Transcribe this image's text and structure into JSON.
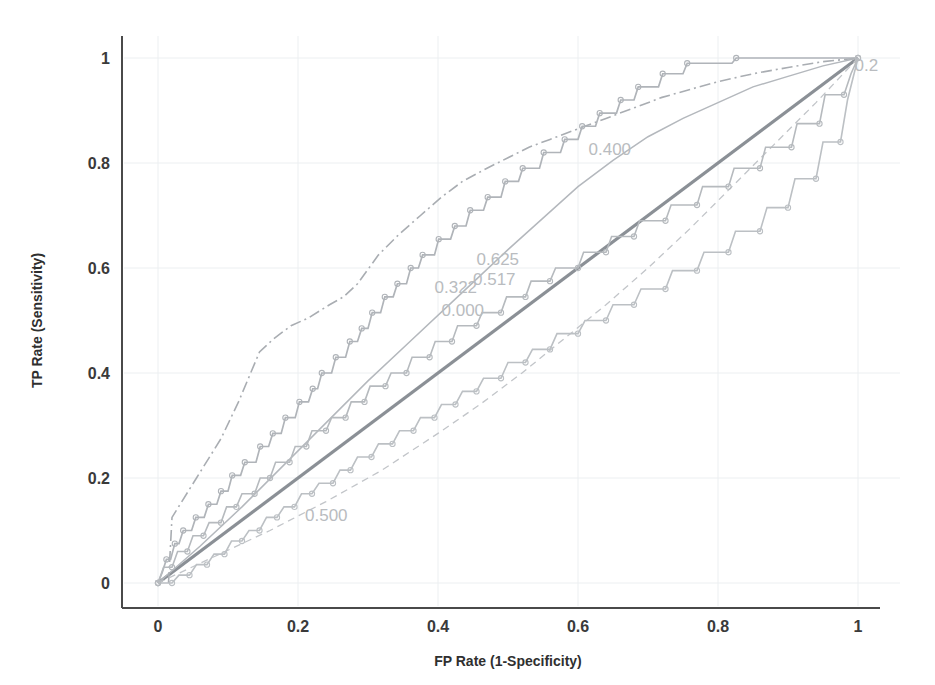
{
  "chart_data": {
    "type": "line",
    "title": "",
    "xlabel": "FP Rate (1-Specificity)",
    "ylabel": "TP Rate (Sensitivity)",
    "xlim": [
      0,
      1
    ],
    "ylim": [
      0,
      1
    ],
    "grid": false,
    "xticks": [
      "0",
      "0.2",
      "0.4",
      "0.6",
      "0.8",
      "1"
    ],
    "xtick_values": [
      0,
      0.2,
      0.4,
      0.6,
      0.8,
      1
    ],
    "yticks": [
      "0",
      "0.2",
      "0.4",
      "0.6",
      "0.8",
      "1"
    ],
    "ytick_values": [
      0,
      0.2,
      0.4,
      0.6,
      0.8,
      1
    ],
    "legend_position": "none",
    "annotations": [
      {
        "text": "0.2",
        "x": 0.995,
        "y": 0.975,
        "color": "#c3c6ca"
      },
      {
        "text": "0.400",
        "x": 0.615,
        "y": 0.815,
        "color": "#c3c6ca"
      },
      {
        "text": "0.625",
        "x": 0.455,
        "y": 0.605,
        "color": "#c0c3c7"
      },
      {
        "text": "0.517",
        "x": 0.45,
        "y": 0.568,
        "color": "#c0c3c7"
      },
      {
        "text": "0.322",
        "x": 0.395,
        "y": 0.552,
        "color": "#c6c9cd"
      },
      {
        "text": "0.000",
        "x": 0.405,
        "y": 0.508,
        "color": "#c6c9cd"
      },
      {
        "text": "0.500",
        "x": 0.21,
        "y": 0.118,
        "color": "#cbced2"
      }
    ],
    "series": [
      {
        "name": "reference-diagonal",
        "style": "solid-thick",
        "color": "#8b9096",
        "width": 3.2,
        "markers": false,
        "points": [
          [
            0,
            0
          ],
          [
            1,
            1
          ]
        ]
      },
      {
        "name": "smooth-roc-upper",
        "style": "solid-thin",
        "color": "#b4b8bd",
        "width": 1.5,
        "markers": false,
        "points": [
          [
            0,
            0
          ],
          [
            0.06,
            0.07
          ],
          [
            0.12,
            0.145
          ],
          [
            0.18,
            0.225
          ],
          [
            0.24,
            0.305
          ],
          [
            0.3,
            0.385
          ],
          [
            0.36,
            0.46
          ],
          [
            0.42,
            0.535
          ],
          [
            0.46,
            0.585
          ],
          [
            0.5,
            0.635
          ],
          [
            0.55,
            0.695
          ],
          [
            0.6,
            0.755
          ],
          [
            0.65,
            0.805
          ],
          [
            0.7,
            0.85
          ],
          [
            0.75,
            0.885
          ],
          [
            0.8,
            0.915
          ],
          [
            0.85,
            0.945
          ],
          [
            0.9,
            0.965
          ],
          [
            0.95,
            0.985
          ],
          [
            1,
            1
          ]
        ]
      },
      {
        "name": "dash-dot-roc",
        "style": "dash-dot",
        "color": "#a9adb2",
        "width": 1.6,
        "markers": false,
        "points": [
          [
            0.015,
            0.0
          ],
          [
            0.02,
            0.125
          ],
          [
            0.055,
            0.2
          ],
          [
            0.09,
            0.275
          ],
          [
            0.115,
            0.345
          ],
          [
            0.145,
            0.44
          ],
          [
            0.165,
            0.465
          ],
          [
            0.19,
            0.49
          ],
          [
            0.215,
            0.505
          ],
          [
            0.245,
            0.53
          ],
          [
            0.265,
            0.545
          ],
          [
            0.285,
            0.57
          ],
          [
            0.315,
            0.625
          ],
          [
            0.345,
            0.665
          ],
          [
            0.375,
            0.7
          ],
          [
            0.405,
            0.735
          ],
          [
            0.435,
            0.765
          ],
          [
            0.47,
            0.79
          ],
          [
            0.5,
            0.81
          ],
          [
            0.53,
            0.83
          ],
          [
            0.56,
            0.845
          ],
          [
            0.6,
            0.865
          ],
          [
            0.64,
            0.885
          ],
          [
            0.68,
            0.905
          ],
          [
            0.72,
            0.925
          ],
          [
            0.76,
            0.94
          ],
          [
            0.8,
            0.955
          ],
          [
            0.85,
            0.97
          ],
          [
            0.9,
            0.982
          ],
          [
            0.95,
            0.993
          ],
          [
            1,
            1
          ]
        ]
      },
      {
        "name": "dashed-lower-roc",
        "style": "dashed",
        "color": "#c2c5c9",
        "width": 1.3,
        "markers": false,
        "points": [
          [
            0,
            0
          ],
          [
            0.08,
            0.05
          ],
          [
            0.16,
            0.1
          ],
          [
            0.24,
            0.155
          ],
          [
            0.32,
            0.215
          ],
          [
            0.4,
            0.285
          ],
          [
            0.46,
            0.34
          ],
          [
            0.52,
            0.4
          ],
          [
            0.58,
            0.465
          ],
          [
            0.64,
            0.53
          ],
          [
            0.7,
            0.6
          ],
          [
            0.76,
            0.675
          ],
          [
            0.82,
            0.755
          ],
          [
            0.88,
            0.835
          ],
          [
            0.94,
            0.915
          ],
          [
            1,
            1
          ]
        ]
      },
      {
        "name": "step-roc-upper",
        "style": "step",
        "color": "#b0b4b9",
        "width": 1.7,
        "markers": true,
        "points": [
          [
            0,
            0
          ],
          [
            0.006,
            0.02
          ],
          [
            0.012,
            0.045
          ],
          [
            0.018,
            0.045
          ],
          [
            0.024,
            0.075
          ],
          [
            0.03,
            0.075
          ],
          [
            0.036,
            0.1
          ],
          [
            0.048,
            0.1
          ],
          [
            0.054,
            0.125
          ],
          [
            0.066,
            0.125
          ],
          [
            0.072,
            0.15
          ],
          [
            0.084,
            0.15
          ],
          [
            0.09,
            0.175
          ],
          [
            0.1,
            0.175
          ],
          [
            0.106,
            0.205
          ],
          [
            0.118,
            0.205
          ],
          [
            0.124,
            0.23
          ],
          [
            0.14,
            0.23
          ],
          [
            0.146,
            0.26
          ],
          [
            0.158,
            0.26
          ],
          [
            0.164,
            0.285
          ],
          [
            0.176,
            0.285
          ],
          [
            0.182,
            0.315
          ],
          [
            0.196,
            0.315
          ],
          [
            0.202,
            0.345
          ],
          [
            0.215,
            0.345
          ],
          [
            0.221,
            0.37
          ],
          [
            0.228,
            0.37
          ],
          [
            0.234,
            0.4
          ],
          [
            0.248,
            0.4
          ],
          [
            0.254,
            0.43
          ],
          [
            0.268,
            0.43
          ],
          [
            0.274,
            0.46
          ],
          [
            0.285,
            0.46
          ],
          [
            0.291,
            0.485
          ],
          [
            0.3,
            0.485
          ],
          [
            0.306,
            0.515
          ],
          [
            0.318,
            0.515
          ],
          [
            0.324,
            0.545
          ],
          [
            0.336,
            0.545
          ],
          [
            0.342,
            0.57
          ],
          [
            0.355,
            0.57
          ],
          [
            0.361,
            0.6
          ],
          [
            0.372,
            0.6
          ],
          [
            0.378,
            0.625
          ],
          [
            0.395,
            0.625
          ],
          [
            0.401,
            0.655
          ],
          [
            0.418,
            0.655
          ],
          [
            0.424,
            0.68
          ],
          [
            0.44,
            0.68
          ],
          [
            0.446,
            0.71
          ],
          [
            0.465,
            0.71
          ],
          [
            0.471,
            0.735
          ],
          [
            0.49,
            0.735
          ],
          [
            0.496,
            0.765
          ],
          [
            0.515,
            0.765
          ],
          [
            0.521,
            0.79
          ],
          [
            0.545,
            0.79
          ],
          [
            0.551,
            0.82
          ],
          [
            0.575,
            0.82
          ],
          [
            0.581,
            0.845
          ],
          [
            0.6,
            0.845
          ],
          [
            0.606,
            0.87
          ],
          [
            0.625,
            0.87
          ],
          [
            0.631,
            0.895
          ],
          [
            0.655,
            0.895
          ],
          [
            0.661,
            0.92
          ],
          [
            0.68,
            0.92
          ],
          [
            0.686,
            0.945
          ],
          [
            0.715,
            0.945
          ],
          [
            0.721,
            0.97
          ],
          [
            0.75,
            0.97
          ],
          [
            0.756,
            0.99
          ],
          [
            0.82,
            0.99
          ],
          [
            0.826,
            1.0
          ],
          [
            1,
            1
          ]
        ]
      },
      {
        "name": "step-roc-lower",
        "style": "step",
        "color": "#bcc0c4",
        "width": 1.6,
        "markers": true,
        "points": [
          [
            0,
            0
          ],
          [
            0.01,
            0.0
          ],
          [
            0.02,
            0.0
          ],
          [
            0.03,
            0.015
          ],
          [
            0.045,
            0.015
          ],
          [
            0.055,
            0.035
          ],
          [
            0.07,
            0.035
          ],
          [
            0.08,
            0.055
          ],
          [
            0.095,
            0.055
          ],
          [
            0.105,
            0.08
          ],
          [
            0.12,
            0.08
          ],
          [
            0.13,
            0.1
          ],
          [
            0.145,
            0.1
          ],
          [
            0.155,
            0.125
          ],
          [
            0.17,
            0.125
          ],
          [
            0.18,
            0.145
          ],
          [
            0.195,
            0.145
          ],
          [
            0.205,
            0.17
          ],
          [
            0.22,
            0.17
          ],
          [
            0.23,
            0.19
          ],
          [
            0.25,
            0.19
          ],
          [
            0.26,
            0.215
          ],
          [
            0.275,
            0.215
          ],
          [
            0.285,
            0.24
          ],
          [
            0.305,
            0.24
          ],
          [
            0.315,
            0.265
          ],
          [
            0.335,
            0.265
          ],
          [
            0.345,
            0.29
          ],
          [
            0.365,
            0.29
          ],
          [
            0.375,
            0.315
          ],
          [
            0.395,
            0.315
          ],
          [
            0.405,
            0.34
          ],
          [
            0.425,
            0.34
          ],
          [
            0.435,
            0.365
          ],
          [
            0.455,
            0.365
          ],
          [
            0.465,
            0.39
          ],
          [
            0.49,
            0.39
          ],
          [
            0.5,
            0.42
          ],
          [
            0.525,
            0.42
          ],
          [
            0.535,
            0.445
          ],
          [
            0.56,
            0.445
          ],
          [
            0.57,
            0.475
          ],
          [
            0.6,
            0.475
          ],
          [
            0.61,
            0.5
          ],
          [
            0.64,
            0.5
          ],
          [
            0.65,
            0.53
          ],
          [
            0.68,
            0.53
          ],
          [
            0.69,
            0.56
          ],
          [
            0.725,
            0.56
          ],
          [
            0.735,
            0.595
          ],
          [
            0.77,
            0.595
          ],
          [
            0.78,
            0.63
          ],
          [
            0.815,
            0.63
          ],
          [
            0.825,
            0.67
          ],
          [
            0.86,
            0.67
          ],
          [
            0.87,
            0.715
          ],
          [
            0.9,
            0.715
          ],
          [
            0.91,
            0.77
          ],
          [
            0.94,
            0.77
          ],
          [
            0.95,
            0.84
          ],
          [
            0.975,
            0.84
          ],
          [
            0.985,
            0.92
          ],
          [
            1,
            1
          ]
        ]
      },
      {
        "name": "step-roc-middle",
        "style": "step",
        "color": "#b6babe",
        "width": 1.6,
        "markers": true,
        "points": [
          [
            0,
            0
          ],
          [
            0.008,
            0.03
          ],
          [
            0.02,
            0.03
          ],
          [
            0.028,
            0.06
          ],
          [
            0.042,
            0.06
          ],
          [
            0.05,
            0.09
          ],
          [
            0.065,
            0.09
          ],
          [
            0.073,
            0.115
          ],
          [
            0.09,
            0.115
          ],
          [
            0.098,
            0.145
          ],
          [
            0.112,
            0.145
          ],
          [
            0.12,
            0.17
          ],
          [
            0.138,
            0.17
          ],
          [
            0.146,
            0.2
          ],
          [
            0.16,
            0.2
          ],
          [
            0.168,
            0.23
          ],
          [
            0.188,
            0.23
          ],
          [
            0.196,
            0.26
          ],
          [
            0.212,
            0.26
          ],
          [
            0.22,
            0.29
          ],
          [
            0.24,
            0.29
          ],
          [
            0.248,
            0.315
          ],
          [
            0.268,
            0.315
          ],
          [
            0.276,
            0.345
          ],
          [
            0.295,
            0.345
          ],
          [
            0.303,
            0.375
          ],
          [
            0.325,
            0.375
          ],
          [
            0.333,
            0.4
          ],
          [
            0.355,
            0.4
          ],
          [
            0.363,
            0.43
          ],
          [
            0.388,
            0.43
          ],
          [
            0.396,
            0.46
          ],
          [
            0.42,
            0.46
          ],
          [
            0.428,
            0.49
          ],
          [
            0.455,
            0.49
          ],
          [
            0.463,
            0.515
          ],
          [
            0.49,
            0.515
          ],
          [
            0.498,
            0.545
          ],
          [
            0.525,
            0.545
          ],
          [
            0.533,
            0.575
          ],
          [
            0.56,
            0.575
          ],
          [
            0.568,
            0.6
          ],
          [
            0.6,
            0.6
          ],
          [
            0.608,
            0.63
          ],
          [
            0.64,
            0.63
          ],
          [
            0.648,
            0.66
          ],
          [
            0.68,
            0.66
          ],
          [
            0.688,
            0.69
          ],
          [
            0.725,
            0.69
          ],
          [
            0.733,
            0.72
          ],
          [
            0.77,
            0.72
          ],
          [
            0.778,
            0.755
          ],
          [
            0.815,
            0.755
          ],
          [
            0.823,
            0.79
          ],
          [
            0.86,
            0.79
          ],
          [
            0.868,
            0.83
          ],
          [
            0.905,
            0.83
          ],
          [
            0.913,
            0.875
          ],
          [
            0.945,
            0.875
          ],
          [
            0.953,
            0.93
          ],
          [
            0.98,
            0.93
          ],
          [
            0.99,
            0.97
          ],
          [
            1,
            1
          ]
        ]
      }
    ]
  },
  "plot_geometry": {
    "left": 158,
    "right": 858,
    "top": 58,
    "bottom": 583,
    "axis_x": 122,
    "axis_y": 608
  }
}
